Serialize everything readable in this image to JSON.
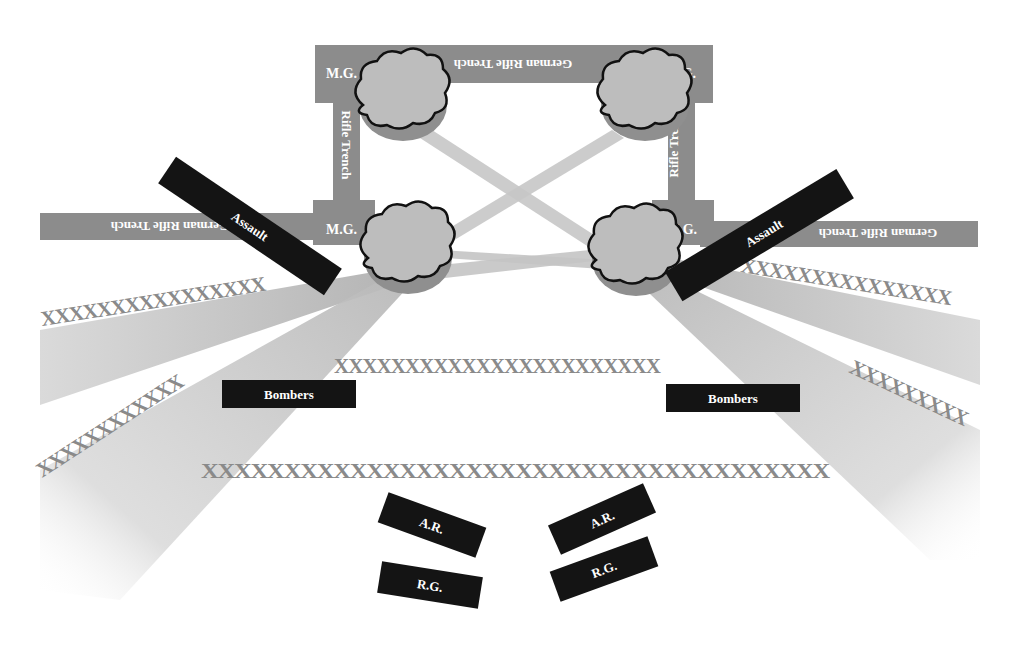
{
  "diagram": {
    "colors": {
      "background": "#ffffff",
      "trench": "#8c8c8c",
      "unit_box": "#141414",
      "unit_text": "#ffffff",
      "wire": "#8a8a8a",
      "fire_beam": "#c8c8c8",
      "cloud_fill": "#bdbdbd",
      "cloud_outline": "#111111"
    },
    "trenches": {
      "top": "German Rifle Trench",
      "left_side": "Rifle Trench",
      "right_side": "Rifle Trench",
      "left_flank": "German Rifle Trench",
      "right_flank": "German Rifle Trench"
    },
    "machine_guns": [
      {
        "id": "mg-top-left",
        "label": "M.G."
      },
      {
        "id": "mg-top-right",
        "label": "M.G."
      },
      {
        "id": "mg-bottom-left",
        "label": "M.G."
      },
      {
        "id": "mg-bottom-right",
        "label": "M.G."
      }
    ],
    "units": {
      "assault_left": "Assault",
      "assault_right": "Assault",
      "bombers_left": "Bombers",
      "bombers_right": "Bombers",
      "ar_left": "A.R.",
      "ar_right": "A.R.",
      "rg_left": "R.G.",
      "rg_right": "R.G."
    },
    "wire": {
      "left_upper": "XXXXXXXXXXXXXXXX",
      "left_lower": "XXXXXXXXXXXX",
      "right_upper": "XXXXXXXXXXXXXXX",
      "right_lower": "XXXXXXXXX",
      "center_upper": "XXXXXXXXXXXXXXXXXXXXXXX",
      "center_lower": "XXXXXXXXXXXXXXXXXXXXXXXXXXXXXXXXXXXXXX"
    }
  }
}
